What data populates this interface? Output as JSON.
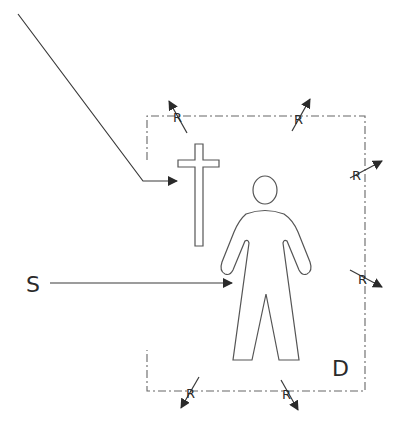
{
  "diagram": {
    "labels": {
      "source": "S",
      "enclosure": "D",
      "radiation": "R"
    },
    "colors": {
      "line": "#3a3a3a",
      "outline": "#555555",
      "boundary": "#666666",
      "background": "#ffffff"
    },
    "enclosure_box": {
      "x1": 147,
      "y1": 116,
      "x2": 365,
      "y2": 391,
      "style": "dash-dot"
    },
    "r_arrows": [
      {
        "id": "r-top-left",
        "position": "top",
        "direction": "up-left"
      },
      {
        "id": "r-top-right",
        "position": "top",
        "direction": "up-right"
      },
      {
        "id": "r-right-upper",
        "position": "right",
        "direction": "right-up"
      },
      {
        "id": "r-right-lower",
        "position": "right",
        "direction": "right-down"
      },
      {
        "id": "r-bottom-left",
        "position": "bottom",
        "direction": "down-left"
      },
      {
        "id": "r-bottom-right",
        "position": "bottom",
        "direction": "down-right"
      }
    ],
    "arrows": [
      {
        "id": "pointer-to-cross",
        "from": [
          18,
          14
        ],
        "via": [
          143,
          181
        ],
        "to": [
          178,
          181
        ]
      },
      {
        "id": "source-to-person",
        "from": [
          50,
          283
        ],
        "to": [
          232,
          283
        ]
      }
    ]
  }
}
